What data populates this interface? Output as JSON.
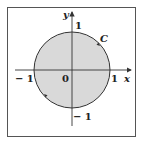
{
  "diagram": {
    "type": "unit-circle-contour",
    "labels": {
      "y_axis": "y",
      "x_axis": "x",
      "curve": "C",
      "origin": "0",
      "x_pos": "1",
      "x_neg": "− 1",
      "y_pos": "1",
      "y_neg": "− 1"
    },
    "colors": {
      "fill": "#d9d9d9",
      "stroke": "#333333",
      "frame": "#555555",
      "background": "#ffffff"
    },
    "orientation": "counterclockwise"
  }
}
